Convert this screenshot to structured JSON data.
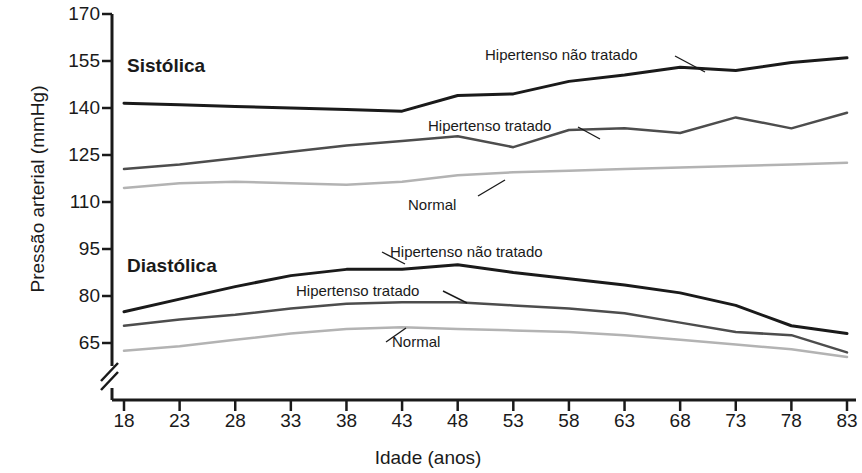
{
  "chart_data": {
    "type": "line",
    "title": "",
    "xlabel": "Idade (anos)",
    "ylabel": "Pressão arterial (mmHg)",
    "xlim": [
      18,
      83
    ],
    "ylim": [
      60,
      170
    ],
    "y_axis_break": true,
    "grid": false,
    "legend_position": "inline-annotations",
    "xticks": [
      18,
      23,
      28,
      33,
      38,
      43,
      48,
      53,
      58,
      63,
      68,
      73,
      78,
      83
    ],
    "yticks": [
      65,
      80,
      95,
      110,
      125,
      140,
      155,
      170
    ],
    "group_labels": [
      {
        "text": "Sistólica",
        "x": 24,
        "y": 157
      },
      {
        "text": "Diastólica",
        "x": 24,
        "y": 91
      }
    ],
    "annotations": [
      {
        "text": "Hipertenso não tratado",
        "group": "Sistólica",
        "x": 55,
        "y": 159
      },
      {
        "text": "Hipertenso tratado",
        "group": "Sistólica",
        "x": 48,
        "y": 136
      },
      {
        "text": "Normal",
        "group": "Sistólica",
        "x": 46,
        "y": 110
      },
      {
        "text": "Hipertenso não tratado",
        "group": "Diastólica",
        "x": 49,
        "y": 93
      },
      {
        "text": "Hipertenso tratado",
        "group": "Diastólica",
        "x": 40,
        "y": 83
      },
      {
        "text": "Normal",
        "group": "Diastólica",
        "x": 44,
        "y": 70
      }
    ],
    "x": [
      18,
      23,
      28,
      33,
      38,
      43,
      48,
      53,
      58,
      63,
      68,
      73,
      78,
      83
    ],
    "series": [
      {
        "name": "Sistólica - Hipertenso não tratado",
        "group": "Sistólica",
        "color": "#1a1a1a",
        "width": 3,
        "values": [
          141.5,
          141.0,
          140.5,
          140.0,
          139.5,
          139.0,
          144.0,
          144.5,
          148.5,
          150.5,
          153.0,
          152.0,
          154.5,
          156.0
        ]
      },
      {
        "name": "Sistólica - Hipertenso tratado",
        "group": "Sistólica",
        "color": "#4d4d4d",
        "width": 2.5,
        "values": [
          120.5,
          122.0,
          124.0,
          126.0,
          128.0,
          129.5,
          131.0,
          127.5,
          133.0,
          133.5,
          132.0,
          137.0,
          133.5,
          138.5
        ]
      },
      {
        "name": "Sistólica - Normal",
        "group": "Sistólica",
        "color": "#b3b3b3",
        "width": 2.5,
        "values": [
          114.5,
          116.0,
          116.5,
          116.0,
          115.5,
          116.5,
          118.5,
          119.5,
          120.0,
          120.5,
          121.0,
          121.5,
          122.0,
          122.5
        ]
      },
      {
        "name": "Diastólica - Hipertenso não tratado",
        "group": "Diastólica",
        "color": "#1a1a1a",
        "width": 3,
        "values": [
          75.0,
          79.0,
          83.0,
          86.5,
          88.5,
          88.5,
          90.0,
          87.5,
          85.5,
          83.5,
          81.0,
          77.0,
          70.5,
          68.0
        ]
      },
      {
        "name": "Diastólica - Hipertenso tratado",
        "group": "Diastólica",
        "color": "#4d4d4d",
        "width": 2.5,
        "values": [
          70.5,
          72.5,
          74.0,
          76.0,
          77.5,
          78.0,
          78.0,
          77.0,
          76.0,
          74.5,
          71.5,
          68.5,
          67.5,
          62.0
        ]
      },
      {
        "name": "Diastólica - Normal",
        "group": "Diastólica",
        "color": "#b3b3b3",
        "width": 2.5,
        "values": [
          62.5,
          64.0,
          66.0,
          68.0,
          69.5,
          70.0,
          69.5,
          69.0,
          68.5,
          67.5,
          66.0,
          64.5,
          63.0,
          60.5
        ]
      }
    ]
  }
}
